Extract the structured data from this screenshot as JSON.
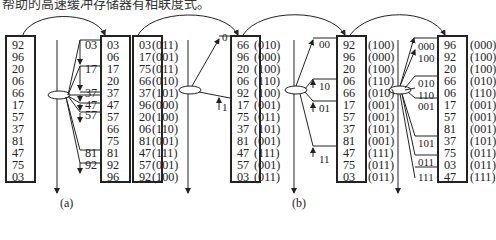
{
  "header": {
    "text": "帮助的高速缓冲存储器有相联度式。"
  },
  "panel_a": {
    "caption": "(a)",
    "input": [
      "92",
      "96",
      "20",
      "06",
      "66",
      "17",
      "57",
      "37",
      "81",
      "47",
      "75",
      "03"
    ],
    "buckets": [
      "03",
      "17",
      "37",
      "47",
      "57",
      "81",
      "92"
    ],
    "output": [
      "03",
      "06",
      "17",
      "20",
      "37",
      "47",
      "57",
      "66",
      "75",
      "81",
      "92",
      "96"
    ]
  },
  "panel_b": {
    "caption": "(b)",
    "stage1": {
      "values": [
        "03",
        "17",
        "75",
        "66",
        "37",
        "96",
        "20",
        "06",
        "81",
        "47",
        "57",
        "92"
      ],
      "bits": [
        "(011)",
        "(001)",
        "(011)",
        "(010)",
        "(101)",
        "(000)",
        "(100)",
        "(110)",
        "(001)",
        "(111)",
        "(001)",
        "(100)"
      ],
      "buckets": [
        "0",
        "1"
      ]
    },
    "stage2": {
      "values": [
        "66",
        "96",
        "20",
        "06",
        "92",
        "17",
        "75",
        "37",
        "81",
        "47",
        "57",
        "03"
      ],
      "bits": [
        "(010)",
        "(000)",
        "(100)",
        "(110)",
        "(100)",
        "(001)",
        "(011)",
        "(101)",
        "(001)",
        "(111)",
        "(001)",
        "(011)"
      ],
      "buckets": [
        "00",
        "10",
        "01",
        "11"
      ]
    },
    "stage3": {
      "values": [
        "92",
        "96",
        "20",
        "06",
        "66",
        "17",
        "57",
        "37",
        "81",
        "47",
        "75",
        "03"
      ],
      "bits": [
        "(100)",
        "(000)",
        "(100)",
        "(110)",
        "(010)",
        "(001)",
        "(001)",
        "(101)",
        "(001)",
        "(111)",
        "(011)",
        "(011)"
      ],
      "buckets": [
        "000",
        "100",
        "010",
        "110",
        "001",
        "101",
        "011",
        "111"
      ]
    },
    "stage4": {
      "values": [
        "96",
        "92",
        "20",
        "66",
        "06",
        "17",
        "57",
        "81",
        "37",
        "75",
        "03",
        "47"
      ],
      "bits": [
        "(000)",
        "(100)",
        "(100)",
        "(010)",
        "(110)",
        "(001)",
        "(001)",
        "(001)",
        "(101)",
        "(011)",
        "(011)",
        "(111)"
      ]
    }
  }
}
